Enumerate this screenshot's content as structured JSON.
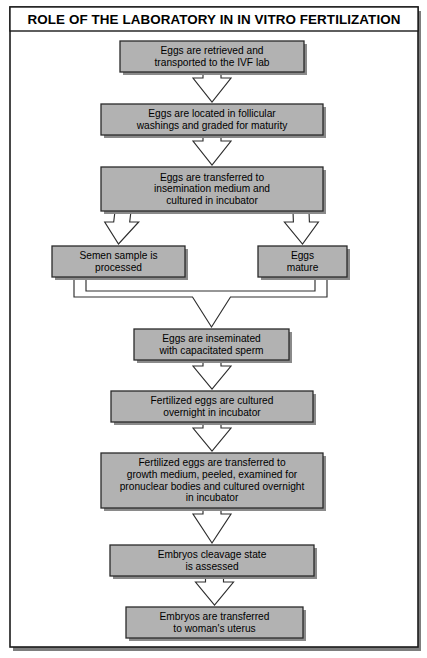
{
  "figure": {
    "title": "ROLE OF THE LABORATORY IN IN VITRO FERTILIZATION",
    "box_fill": "#b2b2b2",
    "box_stroke": "#2a2a2a",
    "connector_fill": "#ffffff",
    "connector_stroke": "#2e2e2e",
    "background": "#ffffff"
  },
  "chart_data": {
    "type": "diagram",
    "diagram_type": "flowchart",
    "title": "ROLE OF THE LABORATORY IN IN VITRO FERTILIZATION",
    "orientation": "top-to-bottom",
    "node_count": 10,
    "nodes": [
      {
        "id": "n1",
        "lines": [
          "Eggs are retrieved and",
          "transported to the IVF lab"
        ],
        "x": 120,
        "y": 41,
        "w": 184,
        "h": 31
      },
      {
        "id": "n2",
        "lines": [
          "Eggs are located in follicular",
          "washings and graded for maturity"
        ],
        "x": 101,
        "y": 104,
        "w": 222,
        "h": 31
      },
      {
        "id": "n3",
        "lines": [
          "Eggs are transferred to",
          "insemination medium and",
          "cultured in incubator"
        ],
        "x": 101,
        "y": 167,
        "w": 222,
        "h": 44
      },
      {
        "id": "n4",
        "lines": [
          "Semen sample is",
          "processed"
        ],
        "x": 52,
        "y": 246,
        "w": 133,
        "h": 31
      },
      {
        "id": "n5",
        "lines": [
          "Eggs",
          "mature"
        ],
        "x": 258,
        "y": 246,
        "w": 89,
        "h": 31
      },
      {
        "id": "n6",
        "lines": [
          "Eggs are inseminated",
          "with capacitated sperm"
        ],
        "x": 134,
        "y": 329,
        "w": 155,
        "h": 31
      },
      {
        "id": "n7",
        "lines": [
          "Fertilized eggs are cultured",
          "overnight in incubator"
        ],
        "x": 111,
        "y": 391,
        "w": 202,
        "h": 31
      },
      {
        "id": "n8",
        "lines": [
          "Fertilized eggs are transferred to",
          "growth medium, peeled, examined for",
          "pronuclear bodies and cultured overnight",
          "in incubator"
        ],
        "x": 101,
        "y": 453,
        "w": 222,
        "h": 55
      },
      {
        "id": "n9",
        "lines": [
          "Embryos cleavage state",
          "is assessed"
        ],
        "x": 110,
        "y": 545,
        "w": 204,
        "h": 31
      },
      {
        "id": "n10",
        "lines": [
          "Embryos are transferred",
          "to woman's uterus"
        ],
        "x": 126,
        "y": 607,
        "w": 177,
        "h": 31
      }
    ],
    "edges": [
      {
        "from": "n1",
        "to": "n2",
        "type": "arrow-down"
      },
      {
        "from": "n2",
        "to": "n3",
        "type": "arrow-down"
      },
      {
        "from": "n3",
        "to": "n4",
        "type": "arrow-branch-left"
      },
      {
        "from": "n3",
        "to": "n5",
        "type": "arrow-branch-right"
      },
      {
        "from": "n4",
        "to": "n6",
        "type": "arrow-merge"
      },
      {
        "from": "n5",
        "to": "n6",
        "type": "arrow-merge"
      },
      {
        "from": "n6",
        "to": "n7",
        "type": "arrow-down"
      },
      {
        "from": "n7",
        "to": "n8",
        "type": "arrow-down"
      },
      {
        "from": "n8",
        "to": "n9",
        "type": "arrow-down"
      },
      {
        "from": "n9",
        "to": "n10",
        "type": "arrow-down"
      }
    ]
  }
}
